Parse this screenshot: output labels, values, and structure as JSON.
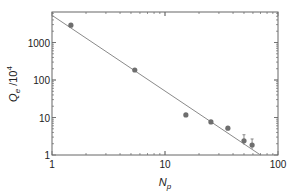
{
  "chart_data": {
    "type": "scatter",
    "title": "",
    "xlabel": "N_p",
    "ylabel": "Q_e /10^4",
    "xscale": "log",
    "yscale": "log",
    "xlim": [
      1,
      100
    ],
    "ylim": [
      1,
      6000
    ],
    "xticks": [
      "1",
      "10",
      "100"
    ],
    "yticks": [
      "1",
      "10",
      "100",
      "1000"
    ],
    "grid": false,
    "legend": null,
    "series": [
      {
        "name": "data",
        "x": [
          1.47,
          5.4,
          15.3,
          25.5,
          36,
          50,
          59
        ],
        "y": [
          2900,
          185,
          11.7,
          7.6,
          5.2,
          2.4,
          1.85
        ],
        "error_bars": [
          false,
          false,
          false,
          false,
          false,
          true,
          true
        ]
      },
      {
        "name": "fit",
        "type": "line",
        "x": [
          1,
          70
        ],
        "y": [
          5300,
          1
        ]
      }
    ],
    "colors": {
      "points": "#6e6e6e",
      "line": "#8a8a8a",
      "axes": "#666666"
    }
  }
}
